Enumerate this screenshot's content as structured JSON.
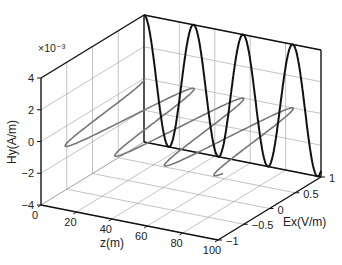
{
  "chart_data": {
    "type": "line",
    "projection": "3d",
    "title": "",
    "xlabel": "z(m)",
    "ylabel": "Ex(V/m)",
    "zlabel": "Hy(A/m)",
    "z_scale_label": "×10⁻³",
    "xlim": [
      0,
      100
    ],
    "ylim": [
      -1,
      1
    ],
    "zlim": [
      -4,
      4
    ],
    "xticks": [
      "0",
      "20",
      "40",
      "60",
      "80",
      "100"
    ],
    "yticks": [
      "-1",
      "-0.5",
      "0",
      "0.5",
      "1"
    ],
    "zticks": [
      "-4",
      "-2",
      "0",
      "2",
      "4"
    ],
    "grid": true,
    "series": [
      {
        "name": "Hy (magnetic field)",
        "plane": "z-Hy at Ex=+1 (back wall)",
        "function": "Hy = 4e-3 * cos(2*pi*z/28)",
        "amplitude": 0.004,
        "wavelength_m": 28,
        "color": "#111111",
        "style": "solid thick"
      },
      {
        "name": "Ex (electric field)",
        "plane": "z-Ex at Hy=0 (mid plane)",
        "function": "Ex = cos(2*pi*z/28)",
        "amplitude": 1,
        "wavelength_m": 28,
        "color": "#777777",
        "style": "solid gray"
      }
    ]
  }
}
